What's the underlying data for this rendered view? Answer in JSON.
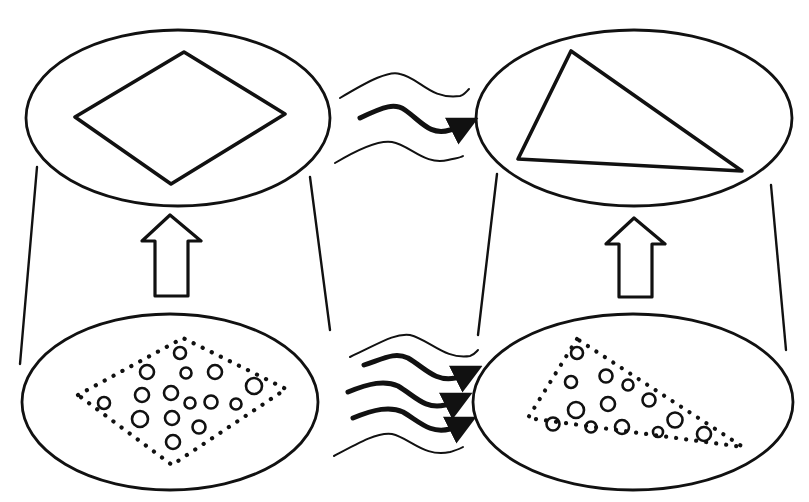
{
  "diagram": {
    "type": "concept-diagram",
    "colors": {
      "ink": "#111111",
      "background": "#ffffff"
    },
    "panels": [
      {
        "id": "top-left",
        "level": "macro",
        "shape": "diamond",
        "ellipse": {
          "cx": 178,
          "cy": 118,
          "rx": 152,
          "ry": 88
        },
        "points": [
          [
            75,
            117
          ],
          [
            184,
            52
          ],
          [
            285,
            114
          ],
          [
            171,
            184
          ]
        ]
      },
      {
        "id": "top-right",
        "level": "macro",
        "shape": "triangle",
        "ellipse": {
          "cx": 634,
          "cy": 118,
          "rx": 158,
          "ry": 88
        },
        "points": [
          [
            571,
            51
          ],
          [
            518,
            159
          ],
          [
            742,
            171
          ]
        ]
      },
      {
        "id": "bottom-left",
        "level": "micro",
        "shape": "dotted-diamond",
        "ellipse": {
          "cx": 170,
          "cy": 402,
          "rx": 148,
          "ry": 88
        },
        "points": [
          [
            78,
            395
          ],
          [
            183,
            338
          ],
          [
            286,
            389
          ],
          [
            172,
            465
          ]
        ],
        "particles": [
          [
            180,
            353,
            6
          ],
          [
            147,
            372,
            7
          ],
          [
            186,
            373,
            6
          ],
          [
            214,
            372,
            7
          ],
          [
            142,
            395,
            7
          ],
          [
            171,
            393,
            7
          ],
          [
            190,
            403,
            6
          ],
          [
            211,
            402,
            7
          ],
          [
            235,
            403,
            6
          ],
          [
            254,
            387,
            8
          ],
          [
            104,
            403,
            6
          ],
          [
            139,
            419,
            8
          ],
          [
            172,
            418,
            7
          ],
          [
            199,
            426,
            7
          ],
          [
            173,
            442,
            7
          ]
        ]
      },
      {
        "id": "bottom-right",
        "level": "micro",
        "shape": "dotted-triangle",
        "ellipse": {
          "cx": 633,
          "cy": 402,
          "rx": 160,
          "ry": 88
        },
        "points": [
          [
            577,
            339
          ],
          [
            528,
            418
          ],
          [
            743,
            447
          ]
        ],
        "particles": [
          [
            577,
            353,
            6
          ],
          [
            571,
            382,
            6
          ],
          [
            606,
            376,
            7
          ],
          [
            630,
            383,
            6
          ],
          [
            608,
            404,
            8
          ],
          [
            635,
            405,
            7
          ],
          [
            662,
            395,
            6
          ],
          [
            648,
            427,
            7
          ],
          [
            583,
            423,
            6
          ],
          [
            591,
            427,
            5
          ],
          [
            623,
            427,
            7
          ],
          [
            678,
            419,
            7
          ],
          [
            704,
            434,
            7
          ],
          [
            658,
            432,
            5
          ]
        ]
      }
    ],
    "connectors": [
      {
        "id": "left-funnel-outer",
        "from": [
          37,
          167
        ],
        "to": [
          20,
          364
        ]
      },
      {
        "id": "left-funnel-inner",
        "from": [
          310,
          177
        ],
        "to": [
          330,
          330
        ]
      },
      {
        "id": "right-funnel-inner",
        "from": [
          497,
          174
        ],
        "to": [
          478,
          335
        ]
      },
      {
        "id": "right-funnel-outer",
        "from": [
          771,
          185
        ],
        "to": [
          786,
          350
        ]
      }
    ],
    "up_arrows": [
      {
        "id": "left-up-arrow",
        "cx": 170,
        "tip_y": 215,
        "base_y": 296
      },
      {
        "id": "right-up-arrow",
        "cx": 634,
        "tip_y": 218,
        "base_y": 297
      }
    ],
    "wavy_arrows": {
      "top": {
        "thin_lines": 2,
        "bold_arrows": 1
      },
      "bottom": {
        "thin_lines": 2,
        "bold_arrows": 3
      }
    }
  }
}
